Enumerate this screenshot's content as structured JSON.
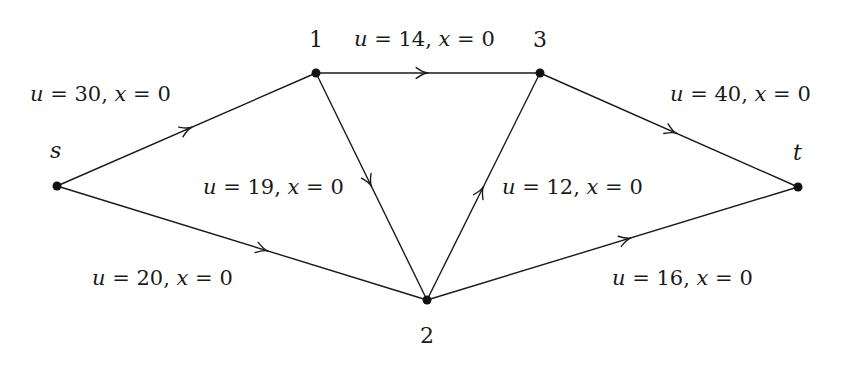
{
  "diagram": {
    "type": "flow-network",
    "nodes": [
      {
        "id": "s",
        "label": "s",
        "x": 57,
        "y": 186,
        "label_x": 50,
        "label_y": 140,
        "italic": true
      },
      {
        "id": "1",
        "label": "1",
        "x": 316,
        "y": 73,
        "label_x": 309,
        "label_y": 29,
        "italic": false
      },
      {
        "id": "3",
        "label": "3",
        "x": 540,
        "y": 73,
        "label_x": 533,
        "label_y": 29,
        "italic": false
      },
      {
        "id": "t",
        "label": "t",
        "x": 798,
        "y": 187,
        "label_x": 793,
        "label_y": 142,
        "italic": true
      },
      {
        "id": "2",
        "label": "2",
        "x": 427,
        "y": 300,
        "label_x": 420,
        "label_y": 325,
        "italic": false
      }
    ],
    "edges": [
      {
        "from": "s",
        "to": "1",
        "u": "30",
        "x": "0",
        "label": "u = 30, x = 0",
        "label_x": 30,
        "label_y": 84,
        "arrow_t": 0.52
      },
      {
        "from": "s",
        "to": "2",
        "u": "20",
        "x": "0",
        "label": "u = 20, x = 0",
        "label_x": 92,
        "label_y": 268,
        "arrow_t": 0.57
      },
      {
        "from": "1",
        "to": "3",
        "u": "14",
        "x": "0",
        "label": "u = 14, x = 0",
        "label_x": 354,
        "label_y": 29,
        "arrow_t": 0.5
      },
      {
        "from": "1",
        "to": "2",
        "u": "19",
        "x": "0",
        "label": "u = 19, x = 0",
        "label_x": 203,
        "label_y": 177,
        "arrow_t": 0.5
      },
      {
        "from": "2",
        "to": "3",
        "u": "12",
        "x": "0",
        "label": "u = 12, x = 0",
        "label_x": 502,
        "label_y": 177,
        "arrow_t": 0.5
      },
      {
        "from": "3",
        "to": "t",
        "u": "40",
        "x": "0",
        "label": "u = 40, x = 0",
        "label_x": 670,
        "label_y": 84,
        "arrow_t": 0.53
      },
      {
        "from": "2",
        "to": "t",
        "u": "16",
        "x": "0",
        "label": "u = 16, x = 0",
        "label_x": 612,
        "label_y": 268,
        "arrow_t": 0.55
      }
    ]
  }
}
